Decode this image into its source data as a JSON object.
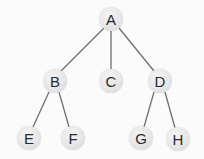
{
  "diagram": {
    "type": "tree",
    "edge_color": "#6e6e6e",
    "node_fill": "#e6e6e6",
    "text_color": "#2a2a2a",
    "nodes": [
      {
        "id": "A",
        "label": "A",
        "x": 111,
        "y": 19
      },
      {
        "id": "B",
        "label": "B",
        "x": 55,
        "y": 81
      },
      {
        "id": "C",
        "label": "C",
        "x": 111,
        "y": 81
      },
      {
        "id": "D",
        "label": "D",
        "x": 160,
        "y": 81
      },
      {
        "id": "E",
        "label": "E",
        "x": 29,
        "y": 138
      },
      {
        "id": "F",
        "label": "F",
        "x": 73,
        "y": 138
      },
      {
        "id": "G",
        "label": "G",
        "x": 141,
        "y": 138
      },
      {
        "id": "H",
        "label": "H",
        "x": 178,
        "y": 139
      }
    ],
    "edges": [
      {
        "from": "A",
        "to": "B"
      },
      {
        "from": "A",
        "to": "C"
      },
      {
        "from": "A",
        "to": "D"
      },
      {
        "from": "B",
        "to": "E"
      },
      {
        "from": "B",
        "to": "F"
      },
      {
        "from": "D",
        "to": "G"
      },
      {
        "from": "D",
        "to": "H"
      }
    ]
  }
}
